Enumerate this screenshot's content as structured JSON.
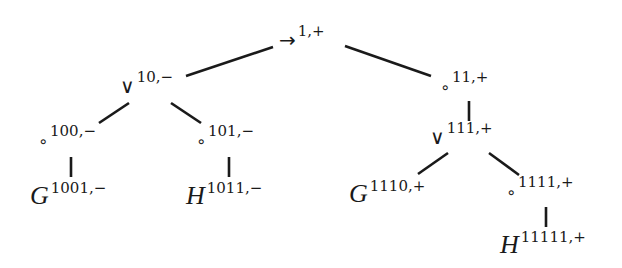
{
  "diagram": {
    "type": "tree",
    "nodes": [
      {
        "id": "root",
        "symbol": "→",
        "label": "1,+",
        "kind": "operator"
      },
      {
        "id": "n10",
        "symbol": "∨",
        "label": "10,−",
        "kind": "operator"
      },
      {
        "id": "n11",
        "symbol": "∘",
        "label": "11,+",
        "kind": "operator"
      },
      {
        "id": "n100",
        "symbol": "∘",
        "label": "100,−",
        "kind": "operator"
      },
      {
        "id": "n101",
        "symbol": "∘",
        "label": "101,−",
        "kind": "operator"
      },
      {
        "id": "n111",
        "symbol": "∨",
        "label": "111,+",
        "kind": "operator"
      },
      {
        "id": "n1001",
        "symbol": "G",
        "label": "1001,−",
        "kind": "variable"
      },
      {
        "id": "n1011",
        "symbol": "H",
        "label": "1011,−",
        "kind": "variable"
      },
      {
        "id": "n1110",
        "symbol": "G",
        "label": "1110,+",
        "kind": "variable"
      },
      {
        "id": "n1111",
        "symbol": "∘",
        "label": "1111,+",
        "kind": "operator"
      },
      {
        "id": "n11111",
        "symbol": "H",
        "label": "11111,+",
        "kind": "variable"
      }
    ],
    "edges": [
      [
        "root",
        "n10"
      ],
      [
        "root",
        "n11"
      ],
      [
        "n10",
        "n100"
      ],
      [
        "n10",
        "n101"
      ],
      [
        "n100",
        "n1001"
      ],
      [
        "n101",
        "n1011"
      ],
      [
        "n11",
        "n111"
      ],
      [
        "n111",
        "n1110"
      ],
      [
        "n111",
        "n1111"
      ],
      [
        "n1111",
        "n11111"
      ]
    ]
  }
}
